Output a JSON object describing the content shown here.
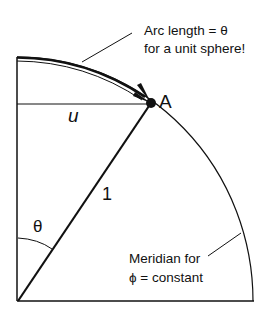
{
  "diagram": {
    "type": "spherical-coordinates-meridian",
    "colors": {
      "background": "#ffffff",
      "ink": "#111111"
    },
    "labels": {
      "point": "A",
      "horizontal_segment": "u",
      "radius": "1",
      "angle": "θ",
      "arc_note_line1": "Arc length = θ",
      "arc_note_line2": "for a unit sphere!",
      "meridian_line1": "Meridian for",
      "meridian_line2": "ϕ = constant"
    }
  }
}
